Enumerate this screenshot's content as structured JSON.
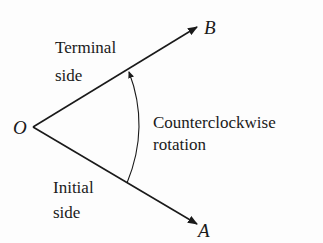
{
  "diagram": {
    "points": {
      "vertex": {
        "label": "O",
        "x": 33,
        "y": 127
      },
      "terminal_end": {
        "label": "B",
        "x": 197,
        "y": 27
      },
      "initial_end": {
        "label": "A",
        "x": 197,
        "y": 224
      }
    },
    "labels": {
      "terminal_line1": "Terminal",
      "terminal_line2": "side",
      "initial_line1": "Initial",
      "initial_line2": "side",
      "rotation_line1": "Counterclockwise",
      "rotation_line2": "rotation"
    },
    "colors": {
      "stroke": "#1a1a1a",
      "background": "#fdfdfd"
    }
  }
}
